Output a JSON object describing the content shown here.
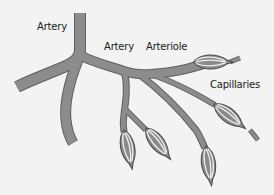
{
  "diagram": {
    "background_color": "#f3f3f3",
    "vessel_fill_color": "#8c8c8c",
    "vessel_outline_color": "#5e5e5e",
    "labels": {
      "artery_main": "Artery",
      "artery_branch": "Artery",
      "arteriole": "Arteriole",
      "capillaries": "Capillaries"
    },
    "structures": [
      {
        "name": "main-artery",
        "type": "vessel"
      },
      {
        "name": "left-artery-branch",
        "type": "vessel"
      },
      {
        "name": "lower-artery-branch",
        "type": "vessel"
      },
      {
        "name": "right-artery-branch",
        "type": "vessel"
      },
      {
        "name": "arterioles",
        "type": "vessel"
      },
      {
        "name": "capillary-beds",
        "type": "capillary",
        "count": 5
      }
    ]
  }
}
